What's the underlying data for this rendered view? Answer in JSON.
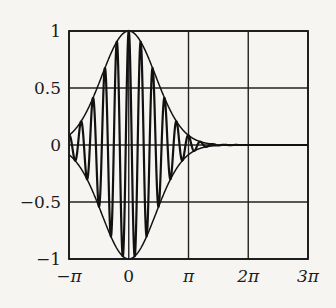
{
  "chart_data": {
    "type": "line",
    "title": "",
    "xlabel": "",
    "ylabel": "",
    "xlim": [
      -3.14159,
      9.42478
    ],
    "ylim": [
      -1,
      1
    ],
    "grid": true,
    "legend": null,
    "x_ticks": [
      -3.14159,
      0,
      3.14159,
      6.28319,
      9.42478
    ],
    "x_tick_labels": [
      "−π",
      "0",
      "π",
      "2π",
      "3π"
    ],
    "y_ticks": [
      1,
      0.5,
      0,
      -0.5,
      -1
    ],
    "y_tick_labels": [
      "1",
      "0.5",
      "0",
      "−0.5",
      "−1"
    ],
    "series": [
      {
        "name": "modulated carrier",
        "description": "Gaussian-modulated cosine, approx. exp(-t^2/4)·cos(10t)",
        "envelope_scale": 4,
        "carrier_frequency": 10,
        "sample_points": [
          {
            "x": -3.14159,
            "y": 0.085
          },
          {
            "x": -1.5708,
            "y": 0.54
          },
          {
            "x": 0,
            "y": 1.0
          },
          {
            "x": 1.5708,
            "y": 0.54
          },
          {
            "x": 3.14159,
            "y": 0.085
          },
          {
            "x": 4.2,
            "y": 0.012
          },
          {
            "x": 6.28319,
            "y": 0.0
          },
          {
            "x": 9.42478,
            "y": 0.0
          }
        ]
      },
      {
        "name": "upper envelope",
        "description": "exp(-t^2/4)"
      },
      {
        "name": "lower envelope",
        "description": "-exp(-t^2/4)"
      }
    ]
  },
  "plot": {
    "px_left": 69,
    "px_right": 308,
    "px_top": 31,
    "px_bottom": 259
  }
}
